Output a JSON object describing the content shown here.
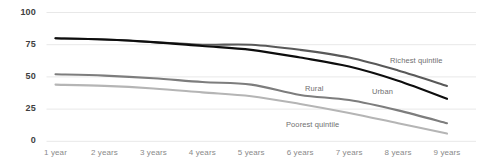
{
  "chart_data": {
    "type": "line",
    "title": "",
    "subtitle": "",
    "xlabel": "",
    "ylabel": "",
    "grid": true,
    "legend_position": "inline-right",
    "ylim": [
      0,
      100
    ],
    "yticks": [
      0,
      25,
      50,
      75,
      100
    ],
    "ytick_labels": [
      "0",
      "25",
      "50",
      "75",
      "100"
    ],
    "categories": [
      "1 year",
      "2 years",
      "3 years",
      "4 years",
      "5 years",
      "6 years",
      "7 years",
      "8 years",
      "9 years"
    ],
    "series": [
      {
        "name": "Richest quintile",
        "color": "#595959",
        "values": [
          80,
          79,
          77,
          75,
          75,
          71,
          65,
          55,
          43
        ]
      },
      {
        "name": "Urban",
        "color": "#0d0d0d",
        "values": [
          80,
          79,
          77,
          74,
          71,
          65,
          58,
          47,
          33
        ]
      },
      {
        "name": "Rural",
        "color": "#7d7d7d",
        "values": [
          52,
          51,
          49,
          46,
          44,
          36,
          32,
          24,
          14
        ]
      },
      {
        "name": "Poorest quintile",
        "color": "#b5b5b5",
        "values": [
          44,
          43,
          41,
          38,
          35,
          29,
          22,
          14,
          6
        ]
      }
    ]
  },
  "axis": {
    "y_labels": [
      "100",
      "75",
      "50",
      "25",
      "0"
    ],
    "x_labels": [
      "1 year",
      "2 years",
      "3 years",
      "4 years",
      "5 years",
      "6 years",
      "7 years",
      "8 years",
      "9 years"
    ]
  },
  "annotations": [
    {
      "text": "Richest quintile",
      "x": 390,
      "y": 56
    },
    {
      "text": "Urban",
      "x": 372,
      "y": 87
    },
    {
      "text": "Rural",
      "x": 305,
      "y": 84
    },
    {
      "text": "Poorest quintile",
      "x": 286,
      "y": 120
    }
  ],
  "colors": {
    "gridline": "#e8e8e8",
    "axis_text": "#3f3f3f",
    "tick_text": "#8a8a8a",
    "annotation_text": "#6f6f6f",
    "background": "#ffffff"
  }
}
